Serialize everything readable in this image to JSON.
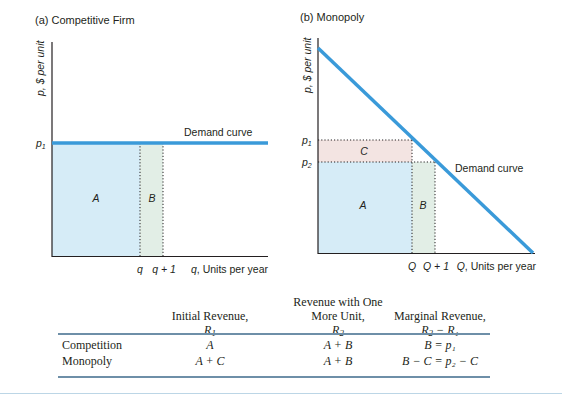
{
  "panel_a": {
    "title": "(a) Competitive Firm",
    "y_axis_label": "p, $ per unit",
    "x_axis_label": "q, Units per year",
    "price_label": "p",
    "price_sub": "1",
    "q_tick": "q",
    "q1_tick": "q + 1",
    "demand_label": "Demand curve",
    "area_a": "A",
    "area_b": "B"
  },
  "panel_b": {
    "title": "(b) Monopoly",
    "y_axis_label": "p, $ per unit",
    "x_axis_label": "Q, Units per year",
    "p1_label": "p",
    "p1_sub": "1",
    "p2_label": "p",
    "p2_sub": "2",
    "q_tick": "Q",
    "q1_tick": "Q + 1",
    "demand_label": "Demand curve",
    "area_a": "A",
    "area_b": "B",
    "area_c": "C"
  },
  "colors": {
    "demand_line": "#3a9ad9",
    "area_a_fill": "#d6ecf7",
    "area_b_fill": "#e2eee6",
    "area_c_fill": "#f3e4e2",
    "axis": "#231f20",
    "rule": "#6e8fa8"
  },
  "table": {
    "headers": [
      {
        "line1": "",
        "line2": "Initial Revenue,",
        "sym": "R",
        "sub": "1",
        "suffix": ""
      },
      {
        "line1": "Revenue with One",
        "line2": "More Unit,",
        "sym": "R",
        "sub": "2",
        "suffix": ""
      },
      {
        "line1": "",
        "line2": "Marginal Revenue,",
        "sym": "R",
        "sub": "2",
        "suffix": " − R₁"
      }
    ],
    "rows": [
      {
        "label": "Competition",
        "initial": "A",
        "one_more": "A + B",
        "marginal": "B = p₁"
      },
      {
        "label": "Monopoly",
        "initial": "A + C",
        "one_more": "A + B",
        "marginal": "B − C = p₂ − C"
      }
    ]
  }
}
